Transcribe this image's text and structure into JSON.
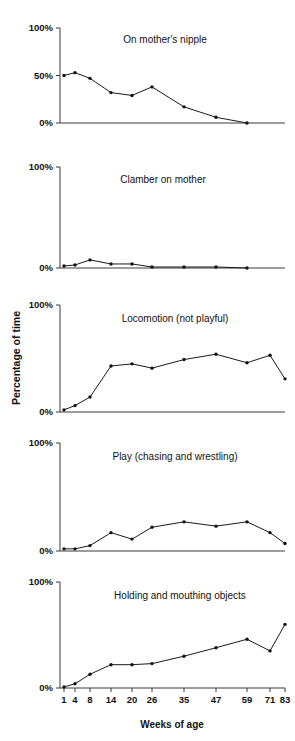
{
  "figure": {
    "xlabel": "Weeks of age",
    "ylabel": "Percentage of time",
    "x_tick_labels": [
      "1",
      "4",
      "8",
      "14",
      "20",
      "26",
      "35",
      "47",
      "59",
      "71",
      "83"
    ],
    "y_tick_labels_full": [
      "100%",
      "50%",
      "0%"
    ],
    "y_tick_labels_simple": [
      "100%",
      "0%"
    ],
    "line_color": "#1a1a1a",
    "marker_color": "#111111",
    "axis_color": "#3a3a3a",
    "background": "#ffffff"
  },
  "chart_data": [
    {
      "type": "line",
      "title": "On mother's nipple",
      "xlabel": "Weeks of age",
      "ylabel": "Percentage of time",
      "x": [
        1,
        4,
        8,
        14,
        20,
        26,
        35,
        47,
        59
      ],
      "categories": [
        "1",
        "4",
        "8",
        "14",
        "20",
        "26",
        "35",
        "47",
        "59"
      ],
      "values": [
        50,
        53,
        47,
        32,
        29,
        38,
        17,
        6,
        0
      ],
      "ylim": [
        0,
        100
      ],
      "yticks": [
        0,
        50,
        100
      ],
      "ytick_labels": [
        "0%",
        "50%",
        "100%"
      ],
      "grid": false,
      "legend": "none"
    },
    {
      "type": "line",
      "title": "Clamber on mother",
      "xlabel": "Weeks of age",
      "ylabel": "Percentage of time",
      "x": [
        1,
        4,
        8,
        14,
        20,
        26,
        35,
        47,
        59
      ],
      "categories": [
        "1",
        "4",
        "8",
        "14",
        "20",
        "26",
        "35",
        "47",
        "59"
      ],
      "values": [
        2,
        3,
        8,
        4,
        4,
        1,
        1,
        1,
        0
      ],
      "ylim": [
        0,
        100
      ],
      "yticks": [
        0,
        100
      ],
      "ytick_labels": [
        "0%",
        "100%"
      ],
      "grid": false,
      "legend": "none"
    },
    {
      "type": "line",
      "title": "Locomotion (not playful)",
      "xlabel": "Weeks of age",
      "ylabel": "Percentage of time",
      "x": [
        1,
        4,
        8,
        14,
        20,
        26,
        35,
        47,
        59,
        71,
        83
      ],
      "categories": [
        "1",
        "4",
        "8",
        "14",
        "20",
        "26",
        "35",
        "47",
        "59",
        "71",
        "83"
      ],
      "values": [
        2,
        6,
        14,
        43,
        45,
        41,
        49,
        54,
        46,
        53,
        31
      ],
      "ylim": [
        0,
        100
      ],
      "yticks": [
        0,
        100
      ],
      "ytick_labels": [
        "0%",
        "100%"
      ],
      "grid": false,
      "legend": "none"
    },
    {
      "type": "line",
      "title": "Play (chasing and wrestling)",
      "xlabel": "Weeks of age",
      "ylabel": "Percentage of time",
      "x": [
        1,
        4,
        8,
        14,
        20,
        26,
        35,
        47,
        59,
        71,
        83
      ],
      "categories": [
        "1",
        "4",
        "8",
        "14",
        "20",
        "26",
        "35",
        "47",
        "59",
        "71",
        "83"
      ],
      "values": [
        2,
        2,
        5,
        17,
        11,
        22,
        27,
        23,
        27,
        17,
        7
      ],
      "ylim": [
        0,
        100
      ],
      "yticks": [
        0,
        100
      ],
      "ytick_labels": [
        "0%",
        "100%"
      ],
      "grid": false,
      "legend": "none"
    },
    {
      "type": "line",
      "title": "Holding and mouthing objects",
      "xlabel": "Weeks of age",
      "ylabel": "Percentage of time",
      "x": [
        1,
        4,
        8,
        14,
        20,
        26,
        35,
        47,
        59,
        71,
        83
      ],
      "categories": [
        "1",
        "4",
        "8",
        "14",
        "20",
        "26",
        "35",
        "47",
        "59",
        "71",
        "83"
      ],
      "values": [
        1,
        4,
        13,
        22,
        22,
        23,
        30,
        38,
        46,
        35,
        60
      ],
      "ylim": [
        0,
        100
      ],
      "yticks": [
        0,
        100
      ],
      "ytick_labels": [
        "0%",
        "100%"
      ],
      "grid": false,
      "legend": "none"
    }
  ]
}
